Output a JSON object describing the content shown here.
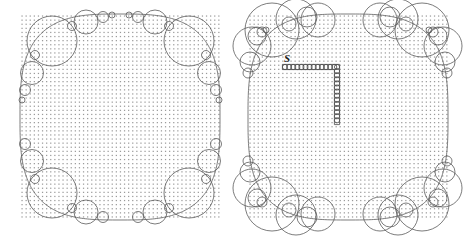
{
  "figure": {
    "title": "",
    "caption": "",
    "type": "geometric-diagram",
    "description": "Two side-by-side square lattice regions with circle packings clustered at the corners; the right region additionally contains an L-shaped lattice path labeled S.",
    "background_color": "#ffffff",
    "stroke_color": "#5a5a5a",
    "dot_color": "#9a9a9a",
    "label_color": "#1a1a1a"
  },
  "panels": [
    {
      "id": "left-panel",
      "name": "left-region",
      "label": "",
      "x": 20,
      "y": 14,
      "width": 200,
      "height": 206,
      "dot_spacing": 4.1,
      "dot_radius": 0.62,
      "inscribed_curve": {
        "kind": "superellipse",
        "exponent": 3.1,
        "cx": 120,
        "cy": 117,
        "rx": 100,
        "ry": 103
      },
      "circle_count": 26,
      "circles": [
        {
          "cx": 52,
          "cy": 41,
          "r": 25
        },
        {
          "cx": 86,
          "cy": 22,
          "r": 12
        },
        {
          "cx": 103,
          "cy": 17,
          "r": 5.5
        },
        {
          "cx": 112,
          "cy": 15,
          "r": 3
        },
        {
          "cx": 32,
          "cy": 73,
          "r": 11.5
        },
        {
          "cx": 25,
          "cy": 90,
          "r": 5.5
        },
        {
          "cx": 22,
          "cy": 100,
          "r": 3
        },
        {
          "cx": 35,
          "cy": 55,
          "r": 4.5
        },
        {
          "cx": 72,
          "cy": 26,
          "r": 4.5
        },
        {
          "cx": 189,
          "cy": 41,
          "r": 25
        },
        {
          "cx": 155,
          "cy": 22,
          "r": 12
        },
        {
          "cx": 138,
          "cy": 17,
          "r": 5.5
        },
        {
          "cx": 129,
          "cy": 15,
          "r": 3
        },
        {
          "cx": 209,
          "cy": 73,
          "r": 11.5
        },
        {
          "cx": 216,
          "cy": 90,
          "r": 5.5
        },
        {
          "cx": 219,
          "cy": 100,
          "r": 3
        },
        {
          "cx": 206,
          "cy": 55,
          "r": 4.5
        },
        {
          "cx": 169,
          "cy": 26,
          "r": 4.5
        },
        {
          "cx": 52,
          "cy": 193,
          "r": 25
        },
        {
          "cx": 86,
          "cy": 212,
          "r": 12
        },
        {
          "cx": 103,
          "cy": 217,
          "r": 5.5
        },
        {
          "cx": 32,
          "cy": 161,
          "r": 11.5
        },
        {
          "cx": 25,
          "cy": 144,
          "r": 5.5
        },
        {
          "cx": 35,
          "cy": 179,
          "r": 4.5
        },
        {
          "cx": 72,
          "cy": 208,
          "r": 4.5
        },
        {
          "cx": 189,
          "cy": 193,
          "r": 25
        },
        {
          "cx": 155,
          "cy": 212,
          "r": 12
        },
        {
          "cx": 138,
          "cy": 217,
          "r": 5.5
        },
        {
          "cx": 209,
          "cy": 161,
          "r": 11.5
        },
        {
          "cx": 216,
          "cy": 144,
          "r": 5.5
        },
        {
          "cx": 206,
          "cy": 179,
          "r": 4.5
        },
        {
          "cx": 169,
          "cy": 208,
          "r": 4.5
        }
      ],
      "path": null
    },
    {
      "id": "right-panel",
      "name": "right-region",
      "label": "S",
      "x": 248,
      "y": 14,
      "width": 200,
      "height": 206,
      "dot_spacing": 4.1,
      "dot_radius": 0.62,
      "inscribed_curve": {
        "kind": "superellipse",
        "exponent": 3.1,
        "cx": 348,
        "cy": 117,
        "rx": 100,
        "ry": 103
      },
      "circle_count": 44,
      "circles": [
        {
          "cx": 272,
          "cy": 30,
          "r": 27
        },
        {
          "cx": 296,
          "cy": 19,
          "r": 20
        },
        {
          "cx": 318,
          "cy": 20,
          "r": 17
        },
        {
          "cx": 307,
          "cy": 17,
          "r": 10
        },
        {
          "cx": 252,
          "cy": 46,
          "r": 19
        },
        {
          "cx": 257,
          "cy": 36,
          "r": 9
        },
        {
          "cx": 262,
          "cy": 32,
          "r": 5
        },
        {
          "cx": 266,
          "cy": 30,
          "r": 3
        },
        {
          "cx": 250,
          "cy": 62,
          "r": 10
        },
        {
          "cx": 248,
          "cy": 73,
          "r": 5
        },
        {
          "cx": 289,
          "cy": 24,
          "r": 7
        },
        {
          "cx": 422,
          "cy": 30,
          "r": 27
        },
        {
          "cx": 398,
          "cy": 19,
          "r": 20
        },
        {
          "cx": 380,
          "cy": 20,
          "r": 17
        },
        {
          "cx": 390,
          "cy": 17,
          "r": 10
        },
        {
          "cx": 443,
          "cy": 46,
          "r": 19
        },
        {
          "cx": 438,
          "cy": 36,
          "r": 9
        },
        {
          "cx": 433,
          "cy": 32,
          "r": 5
        },
        {
          "cx": 429,
          "cy": 30,
          "r": 3
        },
        {
          "cx": 445,
          "cy": 62,
          "r": 10
        },
        {
          "cx": 447,
          "cy": 73,
          "r": 5
        },
        {
          "cx": 406,
          "cy": 24,
          "r": 7
        },
        {
          "cx": 272,
          "cy": 204,
          "r": 27
        },
        {
          "cx": 296,
          "cy": 215,
          "r": 20
        },
        {
          "cx": 318,
          "cy": 214,
          "r": 17
        },
        {
          "cx": 307,
          "cy": 217,
          "r": 10
        },
        {
          "cx": 252,
          "cy": 188,
          "r": 19
        },
        {
          "cx": 257,
          "cy": 198,
          "r": 9
        },
        {
          "cx": 262,
          "cy": 202,
          "r": 5
        },
        {
          "cx": 250,
          "cy": 172,
          "r": 10
        },
        {
          "cx": 248,
          "cy": 161,
          "r": 5
        },
        {
          "cx": 289,
          "cy": 210,
          "r": 7
        },
        {
          "cx": 422,
          "cy": 204,
          "r": 27
        },
        {
          "cx": 398,
          "cy": 215,
          "r": 20
        },
        {
          "cx": 380,
          "cy": 214,
          "r": 17
        },
        {
          "cx": 390,
          "cy": 217,
          "r": 10
        },
        {
          "cx": 443,
          "cy": 188,
          "r": 19
        },
        {
          "cx": 438,
          "cy": 198,
          "r": 9
        },
        {
          "cx": 433,
          "cy": 202,
          "r": 5
        },
        {
          "cx": 445,
          "cy": 172,
          "r": 10
        },
        {
          "cx": 447,
          "cy": 161,
          "r": 5
        },
        {
          "cx": 406,
          "cy": 210,
          "r": 7
        }
      ],
      "path": {
        "name": "l-shaped-lattice-path",
        "label": "S",
        "label_x": 284,
        "label_y": 62,
        "bead_radius": 2.6,
        "bead_spacing": 4.1,
        "horizontal": {
          "x_start": 285,
          "x_end": 337,
          "y": 67
        },
        "vertical": {
          "x": 337,
          "y_start": 67,
          "y_end": 122
        }
      }
    }
  ],
  "legend": {
    "entries": []
  }
}
